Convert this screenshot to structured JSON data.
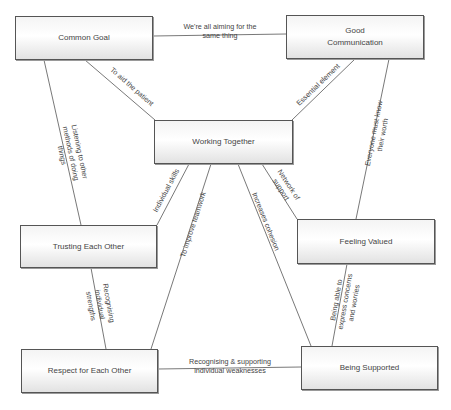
{
  "diagram": {
    "type": "concept-map",
    "nodes": [
      {
        "id": "common-goal",
        "label": "Common Goal"
      },
      {
        "id": "good-communication",
        "label": "Good Communication"
      },
      {
        "id": "working-together",
        "label": "Working Together"
      },
      {
        "id": "trusting-each-other",
        "label": "Trusting Each Other"
      },
      {
        "id": "feeling-valued",
        "label": "Feeling Valued"
      },
      {
        "id": "respect-for-each-other",
        "label": "Respect for Each Other"
      },
      {
        "id": "being-supported",
        "label": "Being Supported"
      }
    ],
    "edges": [
      {
        "from": "common-goal",
        "to": "good-communication",
        "label": "We're all aiming for the same thing"
      },
      {
        "from": "common-goal",
        "to": "working-together",
        "label": "To aid the patient"
      },
      {
        "from": "good-communication",
        "to": "working-together",
        "label": "Essential element"
      },
      {
        "from": "common-goal",
        "to": "trusting-each-other",
        "label": "Listening to other methods of doing things"
      },
      {
        "from": "good-communication",
        "to": "feeling-valued",
        "label": "Everyone must know their worth"
      },
      {
        "from": "working-together",
        "to": "trusting-each-other",
        "label": "Individual skills"
      },
      {
        "from": "working-together",
        "to": "feeling-valued",
        "label": "Network of support"
      },
      {
        "from": "working-together",
        "to": "respect-for-each-other",
        "label": "To improve teamwork"
      },
      {
        "from": "working-together",
        "to": "being-supported",
        "label": "Increases cohesion"
      },
      {
        "from": "trusting-each-other",
        "to": "respect-for-each-other",
        "label": "Recognising individual strengths"
      },
      {
        "from": "feeling-valued",
        "to": "being-supported",
        "label": "Being able to express concerns and worries"
      },
      {
        "from": "respect-for-each-other",
        "to": "being-supported",
        "label": "Recognising & supporting individual weaknesses"
      }
    ]
  },
  "nodes": {
    "common_goal": "Common Goal",
    "good_communication_l1": "Good",
    "good_communication_l2": "Communication",
    "working_together": "Working Together",
    "trusting_each_other": "Trusting Each Other",
    "feeling_valued": "Feeling Valued",
    "respect_for_each_other": "Respect for Each Other",
    "being_supported": "Being Supported"
  },
  "edge_labels": {
    "aiming_l1": "We're all aiming for the",
    "aiming_l2": "same thing",
    "aid_patient": "To aid the patient",
    "essential": "Essential element",
    "listening_l1": "Listening to other",
    "listening_l2": "methods of doing",
    "listening_l3": "things",
    "worth_l1": "Everyone must know",
    "worth_l2": "their worth",
    "individual_skills": "Individual skills",
    "network_l1": "Network of",
    "network_l2": "support",
    "improve_teamwork": "To improve teamwork",
    "cohesion": "Increases cohesion",
    "strengths_l1": "Recognising",
    "strengths_l2": "individual",
    "strengths_l3": "strengths",
    "concerns_l1": "Being able to",
    "concerns_l2": "express concerns",
    "concerns_l3": "and worries",
    "weaknesses_l1": "Recognising & supporting",
    "weaknesses_l2": "individual weaknesses"
  }
}
